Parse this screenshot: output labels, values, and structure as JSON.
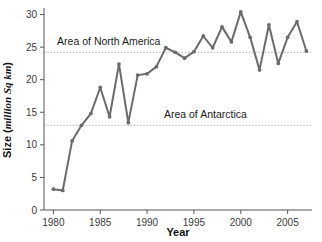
{
  "chart_data": {
    "type": "line",
    "title": "",
    "xlabel": "Year",
    "ylabel": "Size (million Sq km)",
    "ylabel_plain": "Size (",
    "ylabel_italic": "million Sq km",
    "ylabel_close": ")",
    "xlim": [
      1979,
      2007.6
    ],
    "ylim": [
      0,
      31
    ],
    "yticks": [
      0,
      5,
      10,
      15,
      20,
      25,
      30
    ],
    "ytick_labels": [
      "0",
      "5",
      "10",
      "15",
      "20",
      "25",
      "30"
    ],
    "xticks": [
      1980,
      1985,
      1990,
      1995,
      2000,
      2005
    ],
    "xtick_labels": [
      "1980",
      "1985",
      "1990",
      "1995",
      "2000",
      "2005"
    ],
    "grid": false,
    "legend": "none",
    "x": [
      1980,
      1981,
      1982,
      1983,
      1984,
      1985,
      1986,
      1987,
      1988,
      1989,
      1990,
      1991,
      1992,
      1993,
      1994,
      1995,
      1996,
      1997,
      1998,
      1999,
      2000,
      2001,
      2002,
      2003,
      2004,
      2005,
      2006,
      2007
    ],
    "values": [
      3.2,
      3.0,
      10.6,
      13.0,
      14.8,
      18.8,
      14.3,
      22.4,
      13.4,
      20.7,
      20.9,
      22.0,
      24.9,
      24.2,
      23.3,
      24.3,
      26.7,
      24.9,
      28.1,
      25.8,
      30.4,
      26.5,
      21.5,
      28.4,
      22.5,
      26.5,
      28.9,
      24.4
    ],
    "series": [
      {
        "name": "Antarctic ozone hole area",
        "color": "#6b6b6b",
        "values": [
          3.2,
          3.0,
          10.6,
          13.0,
          14.8,
          18.8,
          14.3,
          22.4,
          13.4,
          20.7,
          20.9,
          22.0,
          24.9,
          24.2,
          23.3,
          24.3,
          26.7,
          24.9,
          28.1,
          25.8,
          30.4,
          26.5,
          21.5,
          28.4,
          22.5,
          26.5,
          28.9,
          24.4
        ]
      }
    ],
    "reference_lines": [
      {
        "label": "Area of North America",
        "value": 24.2,
        "color": "#b8b8b8",
        "label_x": 1980.4,
        "label_y": 25.3
      },
      {
        "label": "Area of Antarctica",
        "value": 13.0,
        "color": "#b8b8b8",
        "label_x": 1991.8,
        "label_y": 14.1
      }
    ],
    "colors": {
      "line": "#6b6b6b",
      "axis": "#555555",
      "reference": "#b8b8b8",
      "text": "#1a1a1a",
      "background": "#ffffff"
    }
  }
}
